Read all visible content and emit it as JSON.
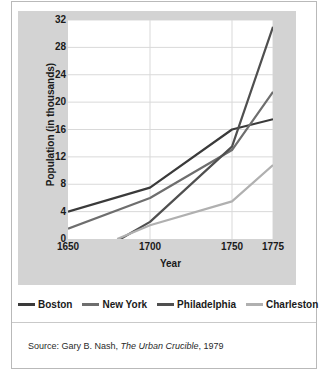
{
  "chart_data": {
    "type": "line",
    "title": "",
    "xlabel": "Year",
    "ylabel": "Population (in thousands)",
    "xlim": [
      1650,
      1775
    ],
    "ylim": [
      0,
      32
    ],
    "xticks": [
      1650,
      1700,
      1750,
      1775
    ],
    "yticks": [
      0,
      4,
      8,
      12,
      16,
      20,
      24,
      28,
      32
    ],
    "grid": true,
    "legend_position": "bottom",
    "series": [
      {
        "name": "Boston",
        "color": "#3a3a3a",
        "x": [
          1650,
          1700,
          1750,
          1775
        ],
        "values": [
          4,
          7.5,
          16,
          17.5
        ]
      },
      {
        "name": "New York",
        "color": "#6e6e6e",
        "x": [
          1650,
          1700,
          1750,
          1775
        ],
        "values": [
          1.5,
          6,
          13,
          21.5
        ]
      },
      {
        "name": "Philadelphia",
        "color": "#4f4f4f",
        "x": [
          1682,
          1700,
          1750,
          1775
        ],
        "values": [
          0,
          2.5,
          13.5,
          31
        ]
      },
      {
        "name": "Charleston",
        "color": "#b0b0b0",
        "x": [
          1680,
          1700,
          1750,
          1775
        ],
        "values": [
          0,
          2,
          5.5,
          10.8
        ]
      }
    ]
  },
  "axis": {
    "y_title": "Population (in thousands)",
    "x_title": "Year",
    "y_tick_labels": [
      "32",
      "28",
      "24",
      "20",
      "16",
      "12",
      "8",
      "4",
      "0"
    ],
    "x_tick_labels": [
      "1650",
      "1700",
      "1750",
      "1775"
    ]
  },
  "legend": {
    "items": [
      {
        "label": "Boston",
        "color": "#3a3a3a"
      },
      {
        "label": "New York",
        "color": "#6e6e6e"
      },
      {
        "label": "Philadelphia",
        "color": "#4f4f4f"
      },
      {
        "label": "Charleston",
        "color": "#b0b0b0"
      }
    ]
  },
  "source": {
    "prefix": "Source: Gary B. Nash, ",
    "title": "The Urban Crucible",
    "suffix": ", 1979"
  },
  "colors": {
    "panel_background": "#d3d3d3",
    "plot_background": "#ffffff",
    "grid": "#d9d9d9",
    "text": "#1a1a1a",
    "frame": "#b9b9b9"
  }
}
